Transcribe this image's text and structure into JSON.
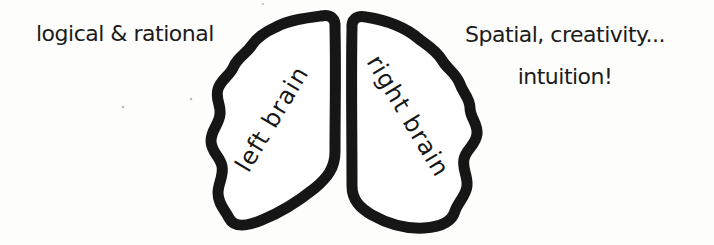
{
  "annotations": {
    "left_note": "logical & rational",
    "right_note_line1": "Spatial, creativity...",
    "right_note_line2": "intuition!"
  },
  "brain": {
    "left_label": "left brain",
    "right_label": "right brain",
    "ink_color": "#161616",
    "fill_color": "#ffffff",
    "paper_color": "#fdfdfc",
    "speck_color": "#bcbcbc"
  }
}
